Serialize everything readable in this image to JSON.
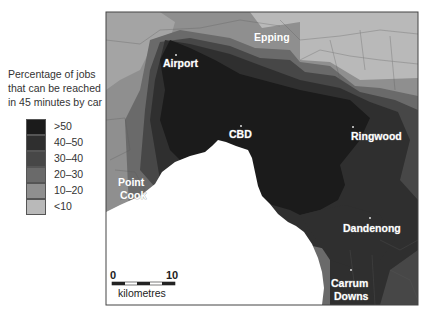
{
  "legend": {
    "title": "Percentage of jobs that can be reached in 45 minutes by car",
    "classes": [
      {
        "label": ">50",
        "color": "#1b1b1b"
      },
      {
        "label": "40–50",
        "color": "#2f2f2f"
      },
      {
        "label": "30–40",
        "color": "#474747"
      },
      {
        "label": "20–30",
        "color": "#6a6a6a"
      },
      {
        "label": "10–20",
        "color": "#8f8f8f"
      },
      {
        "label": "<10",
        "color": "#b9b9b9"
      }
    ]
  },
  "places": {
    "epping": "Epping",
    "airport": "Airport",
    "cbd": "CBD",
    "ringwood": "Ringwood",
    "point_cook_1": "Point",
    "point_cook_2": "Cook",
    "dandenong": "Dandenong",
    "carrum_downs_1": "Carrum",
    "carrum_downs_2": "Downs"
  },
  "scale_bar": {
    "start": "0",
    "end": "10",
    "unit": "kilometres"
  }
}
